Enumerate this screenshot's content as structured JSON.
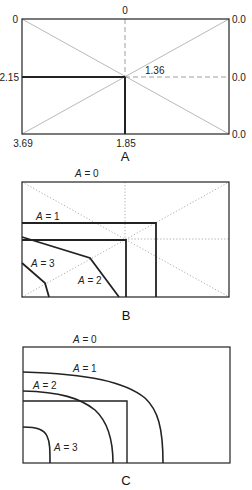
{
  "panels": [
    {
      "id": "A",
      "caption": "A",
      "labels": {
        "top_left": "0",
        "top_center": "0",
        "top_right": "0.0",
        "mid_left": "2.15",
        "mid_right": "0.0",
        "center": "1.36",
        "bottom_left": "3.69",
        "bottom_center": "1.85",
        "bottom_right": "0.0"
      }
    },
    {
      "id": "B",
      "caption": "B",
      "curve_labels": {
        "a0": {
          "var": "A",
          "eq": " = 0"
        },
        "a1": {
          "var": "A",
          "eq": " = 1"
        },
        "a2": {
          "var": "A",
          "eq": " = 2"
        },
        "a3": {
          "var": "A",
          "eq": " = 3"
        }
      }
    },
    {
      "id": "C",
      "caption": "C",
      "curve_labels": {
        "a0": {
          "var": "A",
          "eq": " = 0"
        },
        "a1": {
          "var": "A",
          "eq": " = 1"
        },
        "a2": {
          "var": "A",
          "eq": " = 2"
        },
        "a3": {
          "var": "A",
          "eq": " = 3"
        }
      }
    }
  ],
  "colors": {
    "line": "#222222",
    "guide": "#888888"
  }
}
